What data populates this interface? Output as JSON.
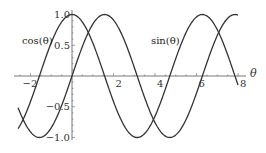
{
  "chart_data": {
    "type": "line",
    "title": "",
    "xlabel": "θ",
    "ylabel": "",
    "xlim": [
      -2.6,
      8.0
    ],
    "ylim": [
      -1.05,
      1.05
    ],
    "grid": false,
    "legend": "inline",
    "x_ticks": [
      -2,
      2,
      4,
      6,
      8
    ],
    "y_ticks": [
      -1.0,
      -0.5,
      0.5,
      1.0
    ],
    "x_tick_labels": [
      "−2",
      "2",
      "4",
      "6",
      "8"
    ],
    "y_tick_labels": [
      "−1.0",
      "−0.5",
      "0.5",
      "1.0"
    ],
    "series": [
      {
        "name": "cos(θ)",
        "function": "cos",
        "label_pos": [
          -1.5,
          0.62
        ],
        "color": "#333333"
      },
      {
        "name": "sin(θ)",
        "function": "sin",
        "label_pos": [
          3.8,
          0.62
        ],
        "color": "#333333"
      }
    ],
    "annotations": [
      "cos(θ)",
      "sin(θ)"
    ]
  },
  "labels": {
    "cos": "cos(θ)",
    "sin": "sin(θ)",
    "x_axis": "θ"
  }
}
